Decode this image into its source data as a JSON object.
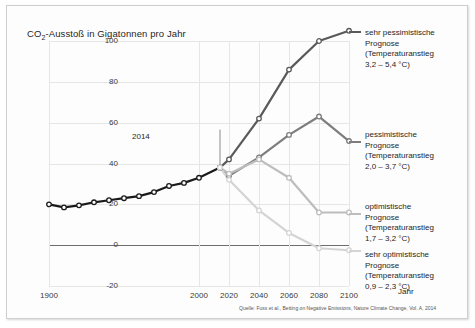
{
  "figure": {
    "title_main": "CO",
    "title_sub": "2",
    "title_rest": "-Ausstoß in Gigatonnen pro Jahr",
    "source": "Quelle: Fuss et al., Betting on Negative Emissions, Nature Climate Change, Vol. A, 2014",
    "annotation": "2014",
    "xaxis_name": "Jahr"
  },
  "chart_data": {
    "type": "line",
    "title": "CO2-Ausstoß in Gigatonnen pro Jahr",
    "xlabel": "Jahr",
    "ylabel": "CO2-Ausstoß in Gigatonnen pro Jahr",
    "xlim": [
      1900,
      2100
    ],
    "ylim": [
      -20,
      100
    ],
    "xticks": [
      "1900",
      "2000",
      "2020",
      "2040",
      "2060",
      "2080",
      "2100"
    ],
    "xtick_values": [
      1900,
      2000,
      2020,
      2040,
      2060,
      2080,
      2100
    ],
    "yticks": [
      "100",
      "80",
      "60",
      "40",
      "20",
      "0",
      "-20"
    ],
    "ytick_values": [
      100,
      80,
      60,
      40,
      20,
      0,
      -20
    ],
    "grid": true,
    "legend_position": "right",
    "annotations": [
      {
        "label": "2014",
        "x": 2014,
        "y": 38
      }
    ],
    "series": [
      {
        "name": "historisch",
        "color": "#1a1a1a",
        "markers": true,
        "x": [
          1900,
          1910,
          1920,
          1930,
          1940,
          1950,
          1960,
          1970,
          1980,
          1990,
          2000,
          2014
        ],
        "values": [
          20,
          18.5,
          19.5,
          21,
          22,
          23,
          24,
          26,
          29,
          30.5,
          33,
          38
        ]
      },
      {
        "name": "sehr pessimistische Prognose",
        "legend_line1": "sehr pessimistische",
        "legend_line2": "Prognose",
        "legend_line3": "(Temperaturanstieg",
        "legend_line4": "3,2 – 5,4 °C)",
        "color": "#5a5a5a",
        "markers": true,
        "x": [
          2014,
          2020,
          2040,
          2060,
          2080,
          2100
        ],
        "values": [
          38,
          42,
          62,
          86,
          100,
          105
        ]
      },
      {
        "name": "pessimistische Prognose",
        "legend_line1": "pessimistische",
        "legend_line2": "Prognose",
        "legend_line3": "(Temperaturanstieg",
        "legend_line4": "2,0 – 3,7 °C)",
        "color": "#7d7d7d",
        "markers": true,
        "x": [
          2014,
          2020,
          2040,
          2060,
          2080,
          2100
        ],
        "values": [
          38,
          34,
          43,
          54,
          63,
          51
        ]
      },
      {
        "name": "optimistische Prognose",
        "legend_line1": "optimistische",
        "legend_line2": "Prognose",
        "legend_line3": "(Temperaturanstieg",
        "legend_line4": "1,7 – 3,2 °C)",
        "color": "#bdbdbd",
        "markers": true,
        "x": [
          2014,
          2020,
          2040,
          2060,
          2080,
          2100
        ],
        "values": [
          38,
          35,
          42,
          33,
          16,
          16
        ]
      },
      {
        "name": "sehr optimistische Prognose",
        "legend_line1": "sehr optimistische",
        "legend_line2": "Prognose",
        "legend_line3": "(Temperaturanstieg",
        "legend_line4": "0,9 – 2,3 °C)",
        "color": "#d4d4d4",
        "markers": true,
        "x": [
          2014,
          2020,
          2040,
          2060,
          2080,
          2100
        ],
        "values": [
          38,
          32,
          17,
          6,
          -1.5,
          -2.5
        ]
      }
    ]
  }
}
